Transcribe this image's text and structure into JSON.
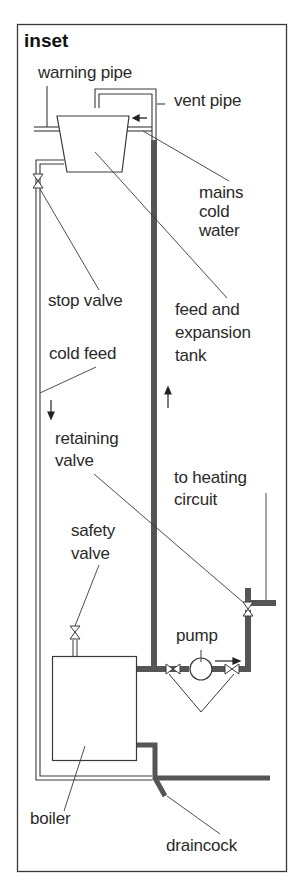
{
  "title": "inset",
  "colors": {
    "line": "#3a3a3a",
    "flow_pipe": "#555555",
    "background": "#ffffff",
    "text": "#2a2a2a"
  },
  "labels": {
    "warning_pipe": "warning pipe",
    "vent_pipe": "vent pipe",
    "mains_cold_water": [
      "mains",
      "cold",
      "water"
    ],
    "stop_valve": "stop valve",
    "feed_and_expansion_tank": [
      "feed and",
      "expansion",
      "tank"
    ],
    "cold_feed": "cold feed",
    "retaining_valve": [
      "retaining",
      "valve"
    ],
    "to_heating_circuit": [
      "to heating",
      "circuit"
    ],
    "safety_valve": [
      "safety",
      "valve"
    ],
    "pump": "pump",
    "boiler": "boiler",
    "draincock": "draincock"
  },
  "components": [
    {
      "name": "feed-and-expansion-tank",
      "shape": "trapezoid"
    },
    {
      "name": "boiler",
      "shape": "rectangle"
    },
    {
      "name": "pump",
      "shape": "circle"
    },
    {
      "name": "stop-valve",
      "shape": "valve"
    },
    {
      "name": "safety-valve",
      "shape": "valve"
    },
    {
      "name": "retaining-valve",
      "shape": "valve"
    },
    {
      "name": "pump-isolating-valves",
      "shape": "valve",
      "count": 2
    },
    {
      "name": "draincock",
      "shape": "angled-pipe"
    }
  ],
  "flow_arrows": [
    {
      "location": "mains inlet",
      "direction": "left"
    },
    {
      "location": "cold feed",
      "direction": "down"
    },
    {
      "location": "flow pipe",
      "direction": "up"
    },
    {
      "location": "pump outlet",
      "direction": "right"
    }
  ]
}
